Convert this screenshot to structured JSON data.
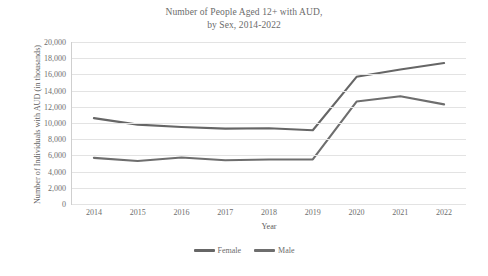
{
  "chart_data": {
    "type": "line",
    "title": "Number of People Aged 12+ with AUD, by Sex, 2014-2022",
    "title_line1": "Number of People Aged 12+ with AUD,",
    "title_line2": "by Sex, 2014-2022",
    "xlabel": "Year",
    "ylabel": "Number of Individuals with AUD (in thousands)",
    "categories": [
      "2014",
      "2015",
      "2016",
      "2017",
      "2018",
      "2019",
      "2020",
      "2021",
      "2022"
    ],
    "x": [
      2014,
      2015,
      2016,
      2017,
      2018,
      2019,
      2020,
      2021,
      2022
    ],
    "series": [
      {
        "name": "Female",
        "color": "#666666",
        "values": [
          10600,
          9800,
          9500,
          9300,
          9350,
          9100,
          15700,
          16600,
          17400
        ]
      },
      {
        "name": "Male",
        "color": "#6e6e6e",
        "values": [
          5700,
          5300,
          5750,
          5400,
          5500,
          5500,
          12650,
          13300,
          12300
        ]
      }
    ],
    "ylim": [
      0,
      20000
    ],
    "ytick_values": [
      0,
      2000,
      4000,
      6000,
      8000,
      10000,
      12000,
      14000,
      16000,
      18000,
      20000
    ],
    "ytick_labels": [
      "0",
      "2,000",
      "4,000",
      "6,000",
      "8,000",
      "10,000",
      "12,000",
      "14,000",
      "16,000",
      "18,000",
      "20,000"
    ],
    "grid": true,
    "legend_position": "bottom",
    "legend_entries": [
      "Female",
      "Male"
    ],
    "background_color": "#ffffff",
    "gridline_color": "#e3e3e3"
  }
}
